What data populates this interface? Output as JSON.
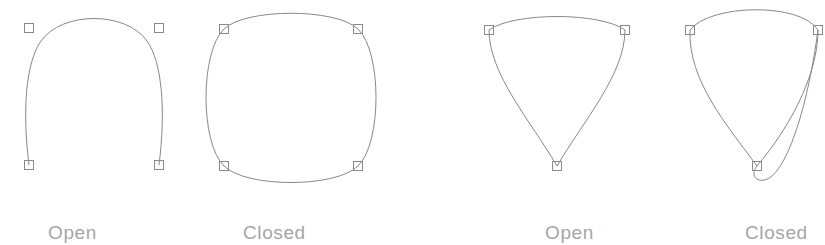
{
  "figure": {
    "background_color": "#ffffff",
    "curve_color": "#888888",
    "node_color": "#8a8a8a",
    "label_color": "#a6a6a6",
    "width": 825,
    "height": 245
  },
  "panels": [
    {
      "id": "panel-open-arch",
      "label": "Open",
      "label_x": 48,
      "curve_type": "open",
      "node_count": 4,
      "nodes": [
        {
          "name": "node-bottom-left",
          "x": 29,
          "y": 165,
          "kind": "endpoint"
        },
        {
          "name": "node-top-left",
          "x": 29,
          "y": 28,
          "kind": "through"
        },
        {
          "name": "node-top-right",
          "x": 159,
          "y": 28,
          "kind": "through"
        },
        {
          "name": "node-bottom-right",
          "x": 159,
          "y": 165,
          "kind": "endpoint"
        }
      ],
      "path": "M 29 165 C 22 110 26 62 41 41 C 62 11 126 11 147 41 C 162 62 166 110 159 165"
    },
    {
      "id": "panel-closed-circle",
      "label": "Closed",
      "label_x": 243,
      "curve_type": "closed",
      "node_count": 4,
      "nodes": [
        {
          "name": "node-top-left",
          "x": 224,
          "y": 29,
          "kind": "through"
        },
        {
          "name": "node-top-right",
          "x": 358,
          "y": 29,
          "kind": "through"
        },
        {
          "name": "node-bottom-right",
          "x": 358,
          "y": 166,
          "kind": "through"
        },
        {
          "name": "node-bottom-left",
          "x": 224,
          "y": 166,
          "kind": "through"
        }
      ],
      "path": "M 224 29 C 246 8 336 8 358 29 C 382 52 382 143 358 166 C 336 188 246 188 224 166 C 200 143 200 52 224 29 Z"
    },
    {
      "id": "panel-open-funnel",
      "label": "Open",
      "label_x": 545,
      "curve_type": "open",
      "node_count": 3,
      "nodes": [
        {
          "name": "node-top-left",
          "x": 489,
          "y": 30,
          "kind": "endpoint"
        },
        {
          "name": "node-bottom",
          "x": 557,
          "y": 166,
          "kind": "through"
        },
        {
          "name": "node-top-right",
          "x": 625,
          "y": 30,
          "kind": "endpoint"
        }
      ],
      "path": "M 489 30 C 489 74 530 120 557 166 C 584 120 625 74 625 30 C 600 12 514 12 489 30"
    },
    {
      "id": "panel-closed-teardrop",
      "label": "Closed",
      "label_x": 745,
      "curve_type": "closed",
      "node_count": 3,
      "nodes": [
        {
          "name": "node-top-left",
          "x": 690,
          "y": 30,
          "kind": "through"
        },
        {
          "name": "node-bottom",
          "x": 757,
          "y": 166,
          "kind": "through"
        },
        {
          "name": "node-top-right",
          "x": 818,
          "y": 30,
          "kind": "through"
        }
      ],
      "path": "M 690 30 C 688 80 726 124 757 166 C 786 132 818 78 818 30 C 800 2 710 4 690 30 Z M 757 166 C 748 177 760 186 772 176 C 790 160 808 104 818 30"
    }
  ]
}
